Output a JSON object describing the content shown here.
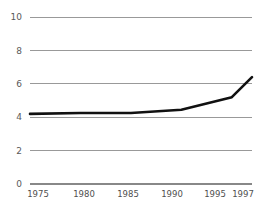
{
  "chart_data": {
    "type": "line",
    "title": "",
    "subtitle": "",
    "xlabel": "",
    "ylabel": "",
    "x": [
      1975,
      1980,
      1985,
      1990,
      1995,
      1997
    ],
    "xtick_labels": [
      "1975",
      "1980",
      "1985",
      "1990",
      "1995",
      "1997"
    ],
    "ytick_labels": [
      "0",
      "2",
      "4",
      "6",
      "8",
      "10"
    ],
    "yticks": [
      0,
      2,
      4,
      6,
      8,
      10
    ],
    "ylim": [
      0,
      10
    ],
    "xlim": [
      1975,
      1997
    ],
    "grid": "horizontal",
    "legend": "none",
    "series": [
      {
        "name": "series-1",
        "color": "#111111",
        "values": [
          4.2,
          4.25,
          4.25,
          4.45,
          5.2,
          6.4
        ]
      }
    ],
    "annotations": []
  },
  "axes": {
    "y_axis_name": "y-axis",
    "x_axis_name": "x-axis",
    "gridline_color": "#999999",
    "baseline_color": "#888888",
    "line_color": "#111111"
  }
}
